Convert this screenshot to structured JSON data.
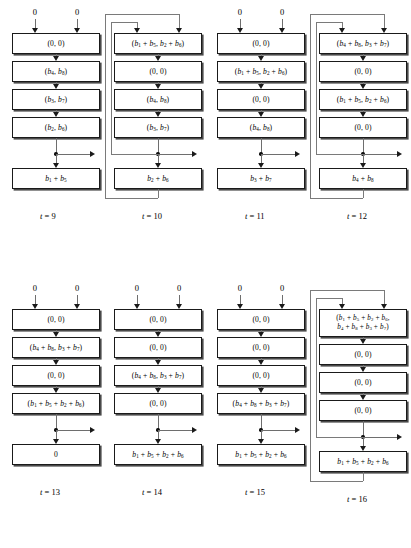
{
  "figure": {
    "type": "block-pipeline-diagram",
    "input_label": "0",
    "rows": 2,
    "cols_per_row": 4
  },
  "style": {
    "box_stroke": "#1a1a1a",
    "box_shadow": "#4a4a4a",
    "wire": "#6e6e6e",
    "feedback_wire": "#7a7a7a",
    "background": "#ffffff",
    "text": "#000000"
  },
  "columns": [
    {
      "id": "t9",
      "caption": "t = 9",
      "inputs": [
        "0",
        "0"
      ],
      "feedback": false,
      "stages": [
        "(0, 0)",
        "(b4, b8)",
        "(b3, b7)",
        "(b2, b6)"
      ],
      "output_box": "b1 + b5",
      "tap_arrow": true
    },
    {
      "id": "t10",
      "caption": "t = 10",
      "inputs": [],
      "feedback": true,
      "stages": [
        "(b1 + b5, b2 + b6)",
        "(0, 0)",
        "(b4, b8)",
        "(b3, b7)"
      ],
      "output_box": "b2 + b6",
      "tap_arrow": true
    },
    {
      "id": "t11",
      "caption": "t = 11",
      "inputs": [
        "0",
        "0"
      ],
      "feedback": false,
      "stages": [
        "(0, 0)",
        "(b1 + b5, b2 + b6)",
        "(0, 0)",
        "(b4, b8)"
      ],
      "output_box": "b3 + b7",
      "tap_arrow": true
    },
    {
      "id": "t12",
      "caption": "t = 12",
      "inputs": [],
      "feedback": true,
      "stages": [
        "(b4 + b8, b3 + b7)",
        "(0, 0)",
        "(b1 + b5, b2 + b6)",
        "(0, 0)"
      ],
      "output_box": "b4 + b8",
      "tap_arrow": true
    },
    {
      "id": "t13",
      "caption": "t = 13",
      "inputs": [
        "0",
        "0"
      ],
      "feedback": false,
      "stages": [
        "(0, 0)",
        "(b4 + b8, b3 + b7)",
        "(0, 0)",
        "(b1 + b5 + b2 + b6)"
      ],
      "output_box": "0",
      "tap_arrow": true
    },
    {
      "id": "t14",
      "caption": "t = 14",
      "inputs": [
        "0",
        "0"
      ],
      "feedback": false,
      "stages": [
        "(0, 0)",
        "(0, 0)",
        "(b4 + b8, b3 + b7)",
        "(0, 0)"
      ],
      "output_box": "b1 + b5 + b2 + b6",
      "tap_arrow": true
    },
    {
      "id": "t15",
      "caption": "t = 15",
      "inputs": [
        "0",
        "0"
      ],
      "feedback": false,
      "stages": [
        "(0, 0)",
        "(0, 0)",
        "(0, 0)",
        "(b4 + b8 + b3 + b7)"
      ],
      "output_box": "b1 + b5 + b2 + b6",
      "tap_arrow": true
    },
    {
      "id": "t16",
      "caption": "t = 16",
      "inputs": [],
      "feedback": true,
      "stages": [
        "(b1 + b5 + b2 + b6, b4 + b8 + b3 + b7)",
        "(0, 0)",
        "(0, 0)",
        "(0, 0)"
      ],
      "stage0_lines": [
        "(b1 + b5 + b2 + b6,",
        "b4 + b8 + b3 + b7)"
      ],
      "output_box": "b1 + b5 + b2 + b6",
      "tap_arrow": true
    }
  ]
}
